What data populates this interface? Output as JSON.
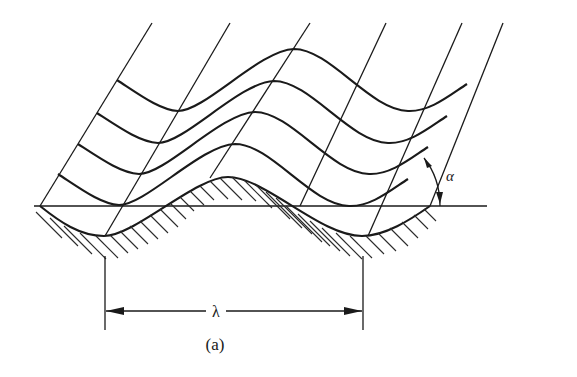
{
  "figure": {
    "caption": "(a)",
    "wavelength_label": "λ",
    "angle_label": "α",
    "colors": {
      "ink": "#1a1a1a",
      "background": "#ffffff"
    }
  },
  "elements": {
    "slanted_lines_count": 6,
    "wave_layers_count": 4,
    "ground_surface": "hatched wavy surface below horizontal baseline",
    "dimension": "wavelength λ between two troughs",
    "angle": "α between slanted lines and horizontal baseline"
  }
}
